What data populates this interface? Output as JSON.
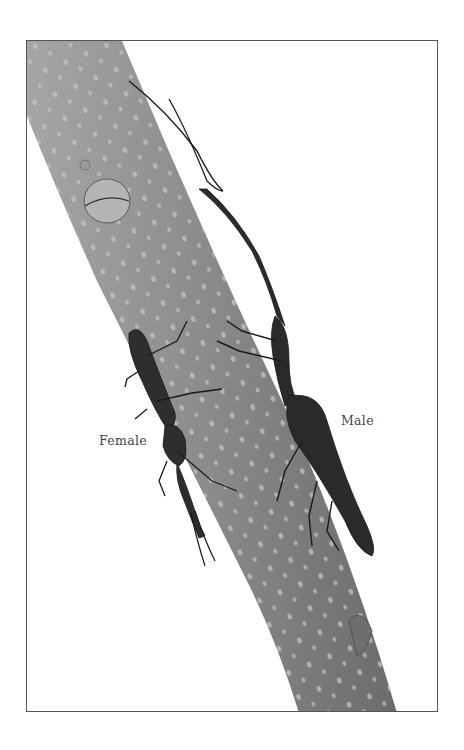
{
  "illustration": {
    "subject": "two longhorn-like beetles on a bark-textured branch",
    "labels": {
      "female": "Female",
      "male": "Male"
    },
    "colors": {
      "frame": "#555555",
      "branch": "#8c8c8c",
      "branch_shadow": "#6e6e6e",
      "beetle": "#2a2a2a",
      "text": "#444444"
    }
  }
}
